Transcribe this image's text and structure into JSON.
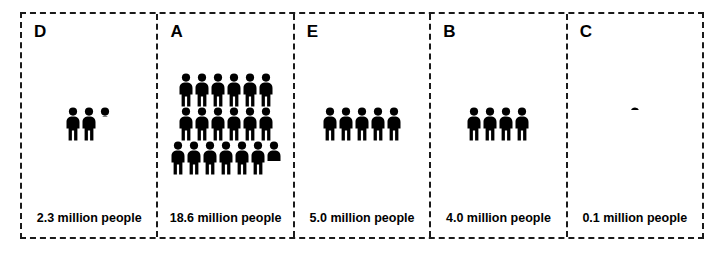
{
  "chart_data": {
    "type": "bar",
    "chart_style": "pictogram",
    "title": "",
    "xlabel": "",
    "ylabel": "",
    "unit_label": "million people",
    "icon_value": 1.0,
    "icon_name": "person-icon",
    "categories": [
      "D",
      "A",
      "E",
      "B",
      "C"
    ],
    "values": [
      2.3,
      18.6,
      5.0,
      4.0,
      0.1
    ],
    "value_labels": [
      "2.3 million people",
      "18.6 million people",
      "5.0 million people",
      "4.0 million people",
      "0.1 million people"
    ],
    "icon_counts": [
      {
        "full": 2,
        "partial": 0.3,
        "rows": [
          3
        ]
      },
      {
        "full": 18,
        "partial": 0.6,
        "rows": [
          6,
          6,
          7
        ]
      },
      {
        "full": 5,
        "partial": 0.0,
        "rows": [
          5
        ]
      },
      {
        "full": 4,
        "partial": 0.0,
        "rows": [
          4
        ]
      },
      {
        "full": 0,
        "partial": 0.1,
        "rows": [
          1
        ]
      }
    ],
    "grid": false,
    "legend": "none"
  },
  "panels": [
    {
      "letter": "D",
      "label": "2.3 million people",
      "value": 2.3,
      "rows": [
        [
          {
            "fill": 1.0
          },
          {
            "fill": 1.0
          },
          {
            "fill": 0.3
          }
        ]
      ]
    },
    {
      "letter": "A",
      "label": "18.6 million people",
      "value": 18.6,
      "rows": [
        [
          {
            "fill": 1.0
          },
          {
            "fill": 1.0
          },
          {
            "fill": 1.0
          },
          {
            "fill": 1.0
          },
          {
            "fill": 1.0
          },
          {
            "fill": 1.0
          }
        ],
        [
          {
            "fill": 1.0
          },
          {
            "fill": 1.0
          },
          {
            "fill": 1.0
          },
          {
            "fill": 1.0
          },
          {
            "fill": 1.0
          },
          {
            "fill": 1.0
          }
        ],
        [
          {
            "fill": 1.0
          },
          {
            "fill": 1.0
          },
          {
            "fill": 1.0
          },
          {
            "fill": 1.0
          },
          {
            "fill": 1.0
          },
          {
            "fill": 1.0
          },
          {
            "fill": 0.6
          }
        ]
      ]
    },
    {
      "letter": "E",
      "label": "5.0 million people",
      "value": 5.0,
      "rows": [
        [
          {
            "fill": 1.0
          },
          {
            "fill": 1.0
          },
          {
            "fill": 1.0
          },
          {
            "fill": 1.0
          },
          {
            "fill": 1.0
          }
        ]
      ]
    },
    {
      "letter": "B",
      "label": "4.0 million people",
      "value": 4.0,
      "rows": [
        [
          {
            "fill": 1.0
          },
          {
            "fill": 1.0
          },
          {
            "fill": 1.0
          },
          {
            "fill": 1.0
          }
        ]
      ]
    },
    {
      "letter": "C",
      "label": "0.1 million people",
      "value": 0.1,
      "rows": [
        [
          {
            "fill": 0.1
          }
        ]
      ]
    }
  ],
  "colors": {
    "icon": "#000000",
    "border": "#1a1a1a",
    "background": "#ffffff",
    "text": "#000000"
  }
}
